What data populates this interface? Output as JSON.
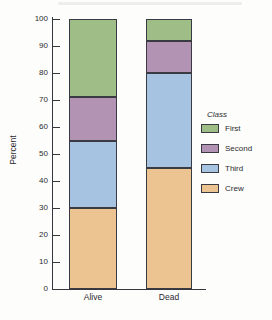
{
  "figure": {
    "background": "#fdfdfb",
    "axis_color": "#36363e",
    "text_color": "#2b2b2f"
  },
  "chart_data": {
    "type": "bar",
    "stacked": true,
    "title": "",
    "xlabel": "",
    "ylabel": "Percent",
    "ylim": [
      0,
      100
    ],
    "yticks": [
      0,
      10,
      20,
      30,
      40,
      50,
      60,
      70,
      80,
      90,
      100
    ],
    "grid": false,
    "categories": [
      "Alive",
      "Dead"
    ],
    "series": [
      {
        "name": "Crew",
        "color": "#ebc492",
        "values": [
          30,
          45
        ]
      },
      {
        "name": "Third",
        "color": "#a6c3e2",
        "values": [
          25,
          35
        ]
      },
      {
        "name": "Second",
        "color": "#b293b3",
        "values": [
          16,
          12
        ]
      },
      {
        "name": "First",
        "color": "#9fbd87",
        "values": [
          29,
          8
        ]
      }
    ],
    "legend": {
      "title": "Class",
      "position": "right",
      "entries": [
        "First",
        "Second",
        "Third",
        "Crew"
      ]
    }
  }
}
